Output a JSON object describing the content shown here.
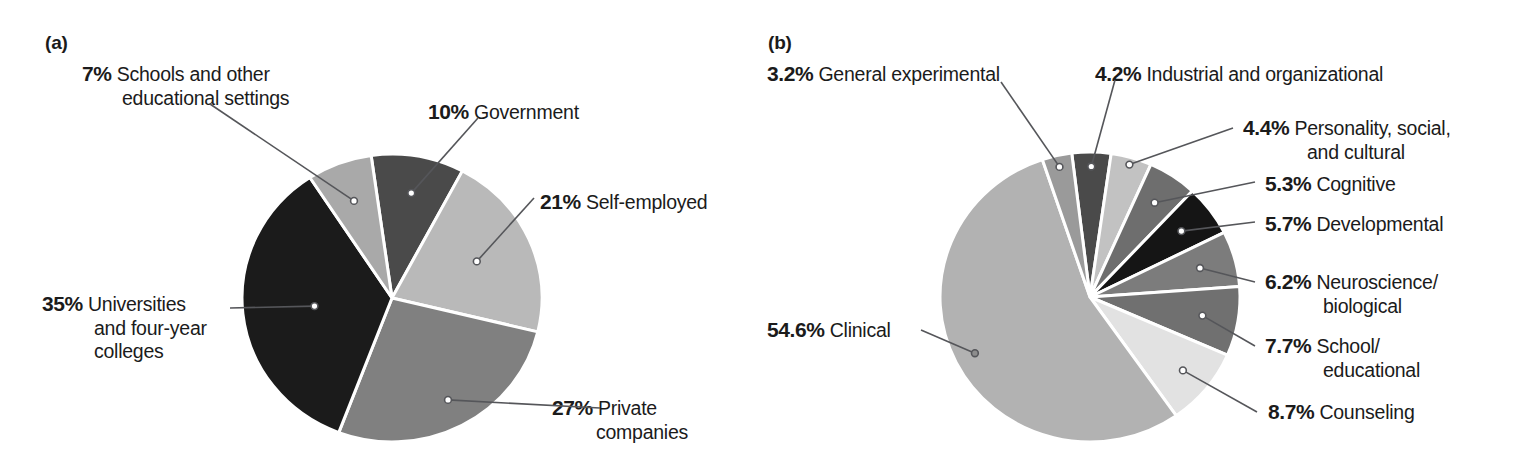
{
  "figure": {
    "panel_a_tag": "(a)",
    "panel_b_tag": "(b)"
  },
  "chart_data": [
    {
      "type": "pie",
      "panel": "(a)",
      "title": "",
      "legend_position": "callout-labels",
      "categories": [
        "Government",
        "Self-employed",
        "Private companies",
        "Universities and four-year colleges",
        "Schools and other educational settings"
      ],
      "values": [
        10,
        21,
        27,
        35,
        7
      ],
      "value_labels": [
        "10%",
        "21%",
        "27%",
        "35%",
        "7%"
      ],
      "colors": [
        "#4a4a4a",
        "#b9b9b9",
        "#808080",
        "#1b1b1b",
        "#a9a9a9"
      ],
      "slices": [
        {
          "pct": "10%",
          "label_line1": "Government",
          "label_line2": "",
          "value": 10,
          "color": "#4a4a4a"
        },
        {
          "pct": "21%",
          "label_line1": "Self-employed",
          "label_line2": "",
          "value": 21,
          "color": "#b9b9b9"
        },
        {
          "pct": "27%",
          "label_line1": "Private",
          "label_line2": "companies",
          "value": 27,
          "color": "#808080"
        },
        {
          "pct": "35%",
          "label_line1": "Universities",
          "label_line2": "and four-year",
          "label_line3": "colleges",
          "value": 35,
          "color": "#1b1b1b"
        },
        {
          "pct": "7%",
          "label_line1": "Schools and other",
          "label_line2": "educational settings",
          "value": 7,
          "color": "#a9a9a9"
        }
      ]
    },
    {
      "type": "pie",
      "panel": "(b)",
      "title": "",
      "legend_position": "callout-labels",
      "categories": [
        "Industrial and organizational",
        "Personality, social, and cultural",
        "Cognitive",
        "Developmental",
        "Neuroscience/biological",
        "School/educational",
        "Counseling",
        "Clinical",
        "General experimental"
      ],
      "values": [
        4.2,
        4.4,
        5.3,
        5.7,
        6.2,
        7.7,
        8.7,
        54.6,
        3.2
      ],
      "value_labels": [
        "4.2%",
        "4.4%",
        "5.3%",
        "5.7%",
        "6.2%",
        "7.7%",
        "8.7%",
        "54.6%",
        "3.2%"
      ],
      "colors": [
        "#4a4a4a",
        "#c2c2c2",
        "#6e6e6e",
        "#151515",
        "#7c7c7c",
        "#707070",
        "#e2e2e2",
        "#b2b2b2",
        "#9a9a9a"
      ],
      "slices": [
        {
          "pct": "4.2%",
          "label_line1": "Industrial and organizational",
          "value": 4.2,
          "color": "#4a4a4a"
        },
        {
          "pct": "4.4%",
          "label_line1": "Personality, social,",
          "label_line2": "and cultural",
          "value": 4.4,
          "color": "#c2c2c2"
        },
        {
          "pct": "5.3%",
          "label_line1": "Cognitive",
          "value": 5.3,
          "color": "#6e6e6e"
        },
        {
          "pct": "5.7%",
          "label_line1": "Developmental",
          "value": 5.7,
          "color": "#151515"
        },
        {
          "pct": "6.2%",
          "label_line1": "Neuroscience/",
          "label_line2": "biological",
          "value": 6.2,
          "color": "#7c7c7c"
        },
        {
          "pct": "7.7%",
          "label_line1": "School/",
          "label_line2": "educational",
          "value": 7.7,
          "color": "#707070"
        },
        {
          "pct": "8.7%",
          "label_line1": "Counseling",
          "value": 8.7,
          "color": "#e2e2e2"
        },
        {
          "pct": "54.6%",
          "label_line1": "Clinical",
          "value": 54.6,
          "color": "#b2b2b2"
        },
        {
          "pct": "3.2%",
          "label_line1": "General experimental",
          "value": 3.2,
          "color": "#9a9a9a"
        }
      ]
    }
  ]
}
